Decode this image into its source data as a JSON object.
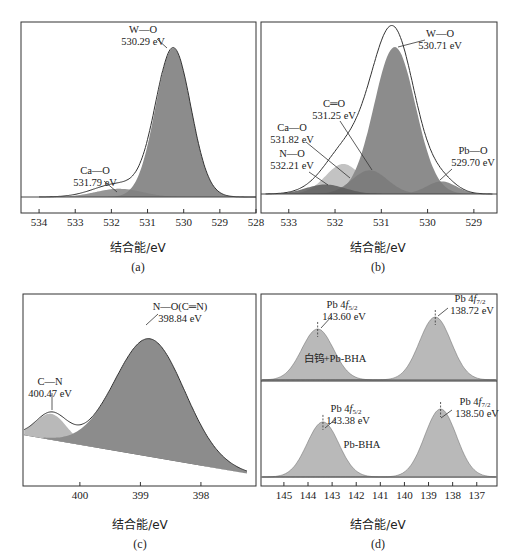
{
  "figure": {
    "panels": [
      "(a)",
      "(b)",
      "(c)",
      "(d)"
    ],
    "xlabel": "结合能/eV"
  },
  "colors": {
    "main_peak": "#8c8c8c",
    "light_peak": "#b9b9b9",
    "mid_peak": "#7a7a7a",
    "dark_peak": "#5a5a5a",
    "frame": "#333333",
    "envelope": "#333333"
  },
  "chart_data": [
    {
      "id": "a",
      "type": "area",
      "title": "(a)",
      "xlabel": "结合能/eV",
      "ylabel": "",
      "xlim": [
        534.5,
        528
      ],
      "x_reversed": true,
      "xticks": [
        534,
        533,
        532,
        531,
        530,
        529,
        528
      ],
      "grid": false,
      "series": [
        {
          "name": "W—O",
          "center": 530.29,
          "label": "530.29 eV",
          "rel_height": 1.0,
          "fwhm": 1.15,
          "fill": "main_peak"
        },
        {
          "name": "Ca—O",
          "center": 531.79,
          "label": "531.79 eV",
          "rel_height": 0.055,
          "fwhm": 1.5,
          "fill": "mid_peak"
        }
      ],
      "annotations": [
        {
          "text": [
            "W—O",
            "530.29 eV"
          ],
          "peak": "W—O"
        },
        {
          "text": [
            "Ca—O",
            "531.79 eV"
          ],
          "peak": "Ca—O"
        }
      ]
    },
    {
      "id": "b",
      "type": "area",
      "title": "(b)",
      "xlabel": "结合能/eV",
      "ylabel": "",
      "xlim": [
        533.6,
        528.5
      ],
      "x_reversed": true,
      "xticks": [
        533,
        532,
        531,
        530,
        529
      ],
      "grid": false,
      "series": [
        {
          "name": "W—O",
          "center": 530.71,
          "label": "530.71 eV",
          "rel_height": 0.93,
          "fwhm": 1.05,
          "fill": "main_peak"
        },
        {
          "name": "C═O",
          "center": 531.25,
          "label": "531.25 eV",
          "rel_height": 0.15,
          "fwhm": 0.9,
          "fill": "mid_peak"
        },
        {
          "name": "Ca—O",
          "center": 531.82,
          "label": "531.82 eV",
          "rel_height": 0.19,
          "fwhm": 0.9,
          "fill": "light_peak"
        },
        {
          "name": "N—O",
          "center": 532.21,
          "label": "532.21 eV",
          "rel_height": 0.06,
          "fwhm": 1.0,
          "fill": "dark_peak"
        },
        {
          "name": "Pb—O",
          "center": 529.7,
          "label": "529.70 eV",
          "rel_height": 0.08,
          "fwhm": 0.75,
          "fill": "mid_peak"
        }
      ],
      "annotations": [
        {
          "text": [
            "W—O",
            "530.71 eV"
          ],
          "peak": "W—O"
        },
        {
          "text": [
            "C═O",
            "531.25 eV"
          ],
          "peak": "C═O"
        },
        {
          "text": [
            "Ca—O",
            "531.82 eV"
          ],
          "peak": "Ca—O"
        },
        {
          "text": [
            "N—O",
            "532.21 eV"
          ],
          "peak": "N—O"
        },
        {
          "text": [
            "Pb—O",
            "529.70 eV"
          ],
          "peak": "Pb—O"
        }
      ]
    },
    {
      "id": "c",
      "type": "area",
      "title": "(c)",
      "xlabel": "结合能/eV",
      "ylabel": "",
      "xlim": [
        400.94,
        397.09
      ],
      "x_reversed": true,
      "xticks": [
        400,
        399,
        398
      ],
      "grid": false,
      "series": [
        {
          "name": "N—O(C═N)",
          "center": 398.84,
          "label": "398.84 eV",
          "rel_height": 1.0,
          "fwhm": 1.35,
          "fill": "main_peak"
        },
        {
          "name": "C—N",
          "center": 400.47,
          "label": "400.47 eV",
          "rel_height": 0.22,
          "fwhm": 0.6,
          "fill": "light_peak"
        }
      ],
      "annotations": [
        {
          "text": [
            "N—O(C═N)",
            "398.84 eV"
          ],
          "peak": "N—O(C═N)"
        },
        {
          "text": [
            "C—N",
            "400.47 eV"
          ],
          "peak": "C—N"
        }
      ]
    },
    {
      "id": "d",
      "type": "area",
      "title": "(d)",
      "xlabel": "结合能/eV",
      "ylabel": "",
      "xlim": [
        145.95,
        136.16
      ],
      "x_reversed": true,
      "xticks": [
        145,
        144,
        143,
        142,
        141,
        140,
        139,
        138,
        137
      ],
      "grid": false,
      "stacked_spectra": [
        {
          "sample": "白钨+Pb-BHA",
          "peaks": [
            {
              "name": "Pb 4f5/2",
              "center": 143.6,
              "label": "143.60 eV",
              "rel_height": 0.81
            },
            {
              "name": "Pb 4f7/2",
              "center": 138.72,
              "label": "138.72 eV",
              "rel_height": 1.0
            }
          ]
        },
        {
          "sample": "Pb-BHA",
          "peaks": [
            {
              "name": "Pb 4f5/2",
              "center": 143.38,
              "label": "143.38 eV",
              "rel_height": 0.81
            },
            {
              "name": "Pb 4f7/2",
              "center": 138.5,
              "label": "138.50 eV",
              "rel_height": 1.0
            }
          ]
        }
      ]
    }
  ],
  "panel_d": {
    "top": {
      "sample_label": "白钨+Pb-BHA",
      "peak1": {
        "name_main": "Pb 4f",
        "sub": "5/2",
        "value": "143.60 eV"
      },
      "peak2": {
        "name_main": "Pb 4f",
        "sub": "7/2",
        "value": "138.72 eV"
      }
    },
    "bottom": {
      "sample_label": "Pb-BHA",
      "peak1": {
        "name_main": "Pb 4f",
        "sub": "5/2",
        "value": "143.38 eV"
      },
      "peak2": {
        "name_main": "Pb 4f",
        "sub": "7/2",
        "value": "138.50 eV"
      }
    }
  }
}
